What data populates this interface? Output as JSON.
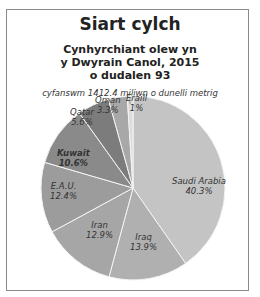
{
  "header": {
    "title": "Siart cylch",
    "subtitle_line1": "Cynhyrchiant olew yn",
    "subtitle_line2": "y Dwyrain Canol, 2015",
    "subtitle_line3": "o dudalen 93",
    "total": "cyfanswm 1412.4 miliwn o dunelli metrig"
  },
  "chart_data": {
    "type": "pie",
    "title": "Cynhyrchiant olew yn y Dwyrain Canol, 2015",
    "subtitle": "cyfanswm 1412.4 miliwn o dunelli metrig",
    "categories": [
      "Saudi Arabia",
      "Iraq",
      "Iran",
      "E.A.U.",
      "Kuwait",
      "Qatar",
      "Oman",
      "Eraill"
    ],
    "values": [
      40.3,
      13.9,
      12.9,
      12.4,
      10.6,
      5.6,
      3.3,
      1
    ],
    "labels": [
      "40.3%",
      "13.9%",
      "12.9%",
      "12.4%",
      "10.6%",
      "5.6%",
      "3.3%",
      "1%"
    ],
    "colors": [
      "#c4c4c4",
      "#b0b0b0",
      "#a6a6a6",
      "#9c9c9c",
      "#8a8a8a",
      "#7c7c7c",
      "#a8a8a8",
      "#dcdcdc"
    ],
    "unit": "%"
  }
}
